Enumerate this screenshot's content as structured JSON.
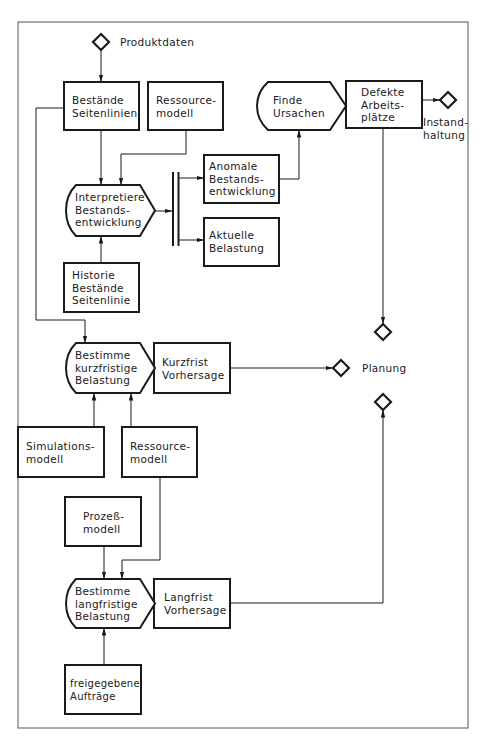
{
  "diagram": {
    "type": "process-flow",
    "language": "de",
    "colors": {
      "line": "#1a1a1a",
      "frame": "#555555",
      "background": "#ffffff"
    },
    "connectors": {
      "produktdaten": {
        "label": "Produktdaten"
      },
      "instandhaltung": {
        "label": "Instand-\nhaltung"
      },
      "planung": {
        "label": "Planung"
      }
    },
    "nodes": {
      "bestaende_seitenlinien": {
        "shape": "box",
        "label": "Bestände\nSeitenlinien"
      },
      "ressourcemodell_top": {
        "shape": "box",
        "label": "Ressource-\nmodell"
      },
      "interpretiere": {
        "shape": "process",
        "label": "Interpretiere\nBestands-\nentwicklung"
      },
      "anomale": {
        "shape": "box",
        "label": "Anomale\nBestands-\nentwicklung"
      },
      "aktuelle": {
        "shape": "box",
        "label": "Aktuelle\nBelastung"
      },
      "finde_ursachen": {
        "shape": "process",
        "label": "Finde\nUrsachen"
      },
      "defekte": {
        "shape": "box",
        "label": "Defekte\nArbeits-\nplätze"
      },
      "historie": {
        "shape": "box",
        "label": "Historie\nBestände\nSeitenlinie"
      },
      "kurzfristig": {
        "shape": "process",
        "label": "Bestimme\nkurzfristige\nBelastung"
      },
      "kurzfrist_vorhersage": {
        "shape": "box",
        "label": "Kurzfrist\nVorhersage"
      },
      "simulationsmodell": {
        "shape": "box",
        "label": "Simulations-\nmodell"
      },
      "ressourcemodell_mid": {
        "shape": "box",
        "label": "Ressource-\nmodell"
      },
      "prozessmodell": {
        "shape": "box",
        "label": "Prozeß-\nmodell"
      },
      "langfristig": {
        "shape": "process",
        "label": "Bestimme\nlangfristige\nBelastung"
      },
      "langfrist_vorhersage": {
        "shape": "box",
        "label": "Langfrist\nVorhersage"
      },
      "freigegebene": {
        "shape": "box",
        "label": "freigegebene\nAufträge"
      }
    },
    "edges": [
      [
        "Produktdaten",
        "Bestände Seitenlinien"
      ],
      [
        "Bestände Seitenlinien",
        "Interpretiere Bestandsentwicklung"
      ],
      [
        "Ressourcemodell",
        "Interpretiere Bestandsentwicklung"
      ],
      [
        "Historie Bestände Seitenlinie",
        "Interpretiere Bestandsentwicklung"
      ],
      [
        "Interpretiere Bestandsentwicklung",
        "Sync-Bar"
      ],
      [
        "Sync-Bar",
        "Anomale Bestandsentwicklung"
      ],
      [
        "Sync-Bar",
        "Aktuelle Belastung"
      ],
      [
        "Anomale Bestandsentwicklung",
        "Finde Ursachen"
      ],
      [
        "Finde Ursachen",
        "Defekte Arbeitsplätze"
      ],
      [
        "Defekte Arbeitsplätze",
        "Instandhaltung"
      ],
      [
        "Defekte Arbeitsplätze",
        "Planung"
      ],
      [
        "Bestände Seitenlinien",
        "Bestimme kurzfristige Belastung"
      ],
      [
        "Simulationsmodell",
        "Bestimme kurzfristige Belastung"
      ],
      [
        "Ressourcemodell",
        "Bestimme kurzfristige Belastung"
      ],
      [
        "Bestimme kurzfristige Belastung",
        "Kurzfrist Vorhersage"
      ],
      [
        "Kurzfrist Vorhersage",
        "Planung"
      ],
      [
        "Ressourcemodell",
        "Bestimme langfristige Belastung"
      ],
      [
        "Prozeßmodell",
        "Bestimme langfristige Belastung"
      ],
      [
        "freigegebene Aufträge",
        "Bestimme langfristige Belastung"
      ],
      [
        "Bestimme langfristige Belastung",
        "Langfrist Vorhersage"
      ],
      [
        "Langfrist Vorhersage",
        "Planung"
      ]
    ]
  }
}
